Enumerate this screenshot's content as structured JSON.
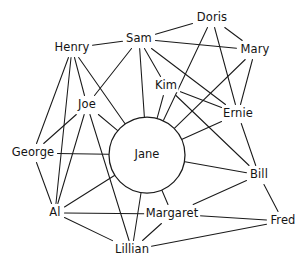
{
  "diagram": {
    "type": "sociogram",
    "title": "",
    "background_color": "#ffffff",
    "line_color": "#1a1a1a",
    "text_color": "#141414",
    "hub": {
      "id": "jane",
      "label": "Jane",
      "cx": 147,
      "cy": 155,
      "r": 38,
      "shape": "circle"
    },
    "nodes": [
      {
        "id": "doris",
        "label": "Doris",
        "x": 212,
        "y": 18,
        "hw": 17,
        "hh": 7
      },
      {
        "id": "sam",
        "label": "Sam",
        "x": 139,
        "y": 39,
        "hw": 14,
        "hh": 7
      },
      {
        "id": "mary",
        "label": "Mary",
        "x": 255,
        "y": 50,
        "hw": 16,
        "hh": 7
      },
      {
        "id": "henry",
        "label": "Henry",
        "x": 72,
        "y": 48,
        "hw": 18,
        "hh": 7
      },
      {
        "id": "kim",
        "label": "Kim",
        "x": 166,
        "y": 86,
        "hw": 12,
        "hh": 7
      },
      {
        "id": "joe",
        "label": "Joe",
        "x": 87,
        "y": 105,
        "hw": 11,
        "hh": 7
      },
      {
        "id": "ernie",
        "label": "Ernie",
        "x": 238,
        "y": 114,
        "hw": 14,
        "hh": 7
      },
      {
        "id": "george",
        "label": "George",
        "x": 33,
        "y": 153,
        "hw": 22,
        "hh": 7
      },
      {
        "id": "bill",
        "label": "Bill",
        "x": 259,
        "y": 175,
        "hw": 10,
        "hh": 7
      },
      {
        "id": "al",
        "label": "Al",
        "x": 55,
        "y": 213,
        "hw": 7,
        "hh": 7
      },
      {
        "id": "margaret",
        "label": "Margaret",
        "x": 172,
        "y": 214,
        "hw": 25,
        "hh": 7
      },
      {
        "id": "fred",
        "label": "Fred",
        "x": 283,
        "y": 221,
        "hw": 14,
        "hh": 7
      },
      {
        "id": "lillian",
        "label": "Lillian",
        "x": 132,
        "y": 250,
        "hw": 17,
        "hh": 7
      }
    ],
    "edges": [
      {
        "from": "jane",
        "to": "sam"
      },
      {
        "from": "jane",
        "to": "henry"
      },
      {
        "from": "jane",
        "to": "joe"
      },
      {
        "from": "jane",
        "to": "kim"
      },
      {
        "from": "jane",
        "to": "doris"
      },
      {
        "from": "jane",
        "to": "ernie"
      },
      {
        "from": "jane",
        "to": "mary"
      },
      {
        "from": "jane",
        "to": "bill"
      },
      {
        "from": "jane",
        "to": "george"
      },
      {
        "from": "jane",
        "to": "al"
      },
      {
        "from": "jane",
        "to": "lillian"
      },
      {
        "from": "jane",
        "to": "margaret"
      },
      {
        "from": "sam",
        "to": "doris"
      },
      {
        "from": "sam",
        "to": "mary"
      },
      {
        "from": "sam",
        "to": "henry"
      },
      {
        "from": "sam",
        "to": "kim"
      },
      {
        "from": "sam",
        "to": "joe"
      },
      {
        "from": "sam",
        "to": "ernie"
      },
      {
        "from": "doris",
        "to": "mary"
      },
      {
        "from": "doris",
        "to": "ernie"
      },
      {
        "from": "mary",
        "to": "ernie"
      },
      {
        "from": "kim",
        "to": "ernie"
      },
      {
        "from": "kim",
        "to": "bill"
      },
      {
        "from": "ernie",
        "to": "bill"
      },
      {
        "from": "bill",
        "to": "fred"
      },
      {
        "from": "bill",
        "to": "margaret"
      },
      {
        "from": "henry",
        "to": "george"
      },
      {
        "from": "henry",
        "to": "al"
      },
      {
        "from": "henry",
        "to": "joe"
      },
      {
        "from": "joe",
        "to": "george"
      },
      {
        "from": "joe",
        "to": "lillian"
      },
      {
        "from": "joe",
        "to": "al"
      },
      {
        "from": "george",
        "to": "al"
      },
      {
        "from": "al",
        "to": "margaret"
      },
      {
        "from": "al",
        "to": "lillian"
      },
      {
        "from": "margaret",
        "to": "fred"
      },
      {
        "from": "margaret",
        "to": "lillian"
      },
      {
        "from": "lillian",
        "to": "fred"
      }
    ]
  }
}
